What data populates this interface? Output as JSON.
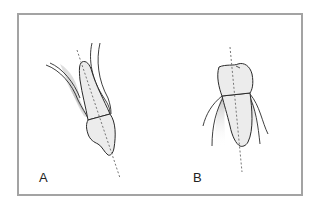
{
  "panels": [
    {
      "id": "A",
      "label": "A",
      "description": "Tooth tilted with dashed long axis, surrounding tissue lines"
    },
    {
      "id": "B",
      "label": "B",
      "description": "Upright tooth with vertical dashed long axis, surrounding tissue lines"
    }
  ],
  "colors": {
    "frame_border": "#a3a3a3",
    "outline": "#2a2a2a",
    "tooth_fill": "#ececec",
    "shadow": "#bdbdbd",
    "axis": "#777777"
  }
}
